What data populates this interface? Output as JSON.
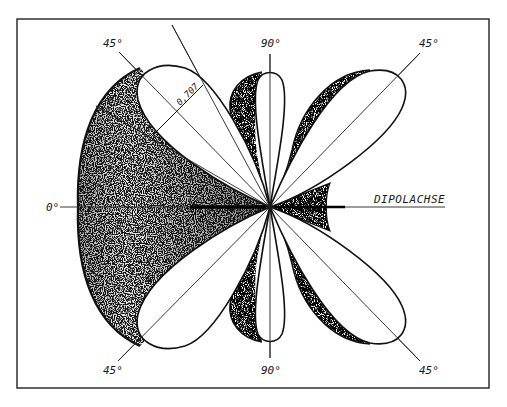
{
  "figure": {
    "type": "3d-radiation-pattern",
    "colors": {
      "ink": "#111111",
      "background": "#ffffff",
      "stipple": "#333333"
    }
  },
  "labels": {
    "angle_top_left": "45°",
    "angle_top_center": "90°",
    "angle_top_right": "45°",
    "angle_left": "0°",
    "axis_name": "DIPOLACHSE",
    "angle_bottom_left": "45°",
    "angle_bottom_center": "90°",
    "angle_bottom_right": "45°",
    "half_power_width": "0,707"
  },
  "geometry": {
    "center": [
      270,
      207
    ],
    "frame": {
      "x": 17,
      "y": 19,
      "width": 472,
      "height": 369
    }
  }
}
